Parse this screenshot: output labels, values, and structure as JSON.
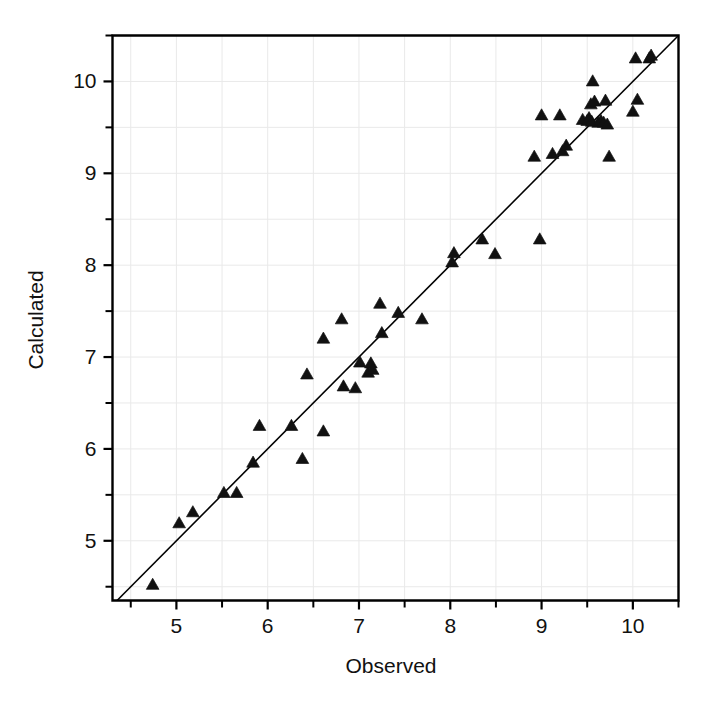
{
  "chart_data": {
    "type": "scatter",
    "title": "",
    "xlabel": "Observed",
    "ylabel": "Calculated",
    "xlim": [
      4.3,
      10.5
    ],
    "ylim": [
      4.35,
      10.5
    ],
    "xticks": [
      5,
      6,
      7,
      8,
      9,
      10
    ],
    "yticks": [
      5,
      6,
      7,
      8,
      9,
      10
    ],
    "xtick_labels": [
      "5",
      "6",
      "7",
      "8",
      "9",
      "10"
    ],
    "ytick_labels": [
      "5",
      "6",
      "7",
      "8",
      "9",
      "10"
    ],
    "xminor_ticks": [
      4.5,
      5.5,
      6.5,
      7.5,
      8.5,
      9.5,
      10.5
    ],
    "yminor_ticks": [
      4.5,
      5.5,
      6.5,
      7.5,
      8.5,
      9.5,
      10.5
    ],
    "grid": true,
    "legend": "none",
    "marker": "triangle-up",
    "marker_color": "#111111",
    "reference_line": {
      "label": "y = x",
      "x0": 4.35,
      "y0": 4.35,
      "x1": 10.5,
      "y1": 10.5
    },
    "x": [
      4.74,
      5.03,
      5.18,
      5.52,
      5.66,
      5.84,
      5.91,
      6.26,
      6.38,
      6.43,
      6.61,
      6.61,
      6.81,
      6.83,
      6.96,
      7.01,
      7.1,
      7.13,
      7.15,
      7.23,
      7.25,
      7.43,
      7.69,
      8.02,
      8.04,
      8.35,
      8.49,
      8.92,
      8.98,
      9.0,
      9.12,
      9.2,
      9.23,
      9.27,
      9.45,
      9.5,
      9.52,
      9.54,
      9.55,
      9.56,
      9.58,
      9.62,
      9.65,
      9.68,
      9.7,
      9.72,
      9.74,
      10.0,
      10.03,
      10.05,
      10.18,
      10.2
    ],
    "y": [
      4.52,
      5.19,
      5.31,
      5.52,
      5.52,
      5.85,
      6.25,
      6.25,
      5.89,
      6.81,
      7.2,
      6.19,
      7.41,
      6.68,
      6.66,
      6.94,
      6.83,
      6.93,
      6.86,
      7.58,
      7.26,
      7.48,
      7.41,
      8.03,
      8.13,
      8.28,
      8.12,
      9.18,
      8.28,
      9.63,
      9.21,
      9.63,
      9.24,
      9.3,
      9.58,
      9.57,
      9.6,
      9.75,
      9.56,
      10.0,
      9.78,
      9.55,
      9.57,
      9.55,
      9.79,
      9.53,
      9.18,
      9.67,
      10.25,
      9.8,
      10.25,
      10.28
    ]
  },
  "axes": {
    "x_title": "Observed",
    "y_title": "Calculated"
  }
}
